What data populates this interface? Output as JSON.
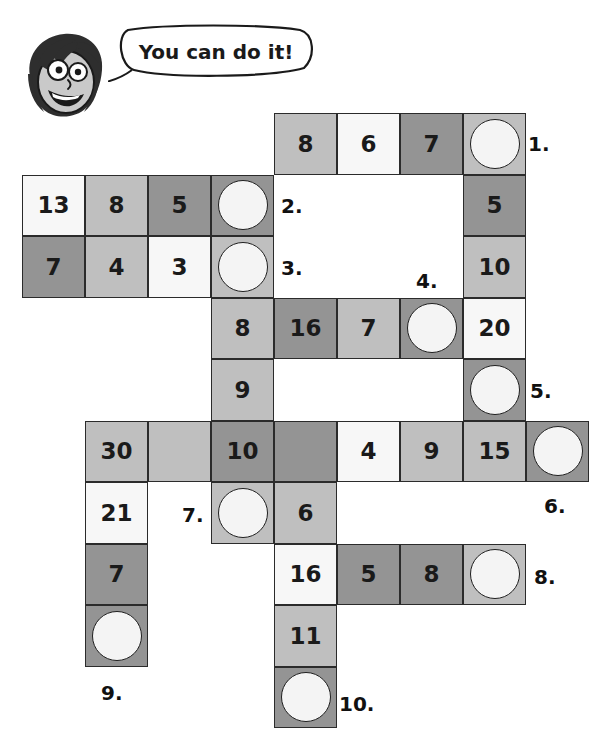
{
  "mascot": {
    "icon": "smiling-face-icon",
    "speech": "You can do it!"
  },
  "grid": {
    "origin_x": 22,
    "origin_y": 113,
    "cell_w": 63,
    "cell_h": 61.5,
    "shades": {
      "light": "#f7f7f7",
      "medium": "#bfbfbf",
      "dark": "#949494"
    },
    "cells": [
      {
        "col": 4,
        "row": 0,
        "value": "8",
        "shade": "medium",
        "circle": false
      },
      {
        "col": 5,
        "row": 0,
        "value": "6",
        "shade": "light",
        "circle": false
      },
      {
        "col": 6,
        "row": 0,
        "value": "7",
        "shade": "dark",
        "circle": false
      },
      {
        "col": 7,
        "row": 0,
        "value": "",
        "shade": "medium",
        "circle": true
      },
      {
        "col": 0,
        "row": 1,
        "value": "13",
        "shade": "light",
        "circle": false
      },
      {
        "col": 1,
        "row": 1,
        "value": "8",
        "shade": "medium",
        "circle": false
      },
      {
        "col": 2,
        "row": 1,
        "value": "5",
        "shade": "dark",
        "circle": false
      },
      {
        "col": 3,
        "row": 1,
        "value": "",
        "shade": "dark",
        "circle": true
      },
      {
        "col": 7,
        "row": 1,
        "value": "5",
        "shade": "dark",
        "circle": false
      },
      {
        "col": 0,
        "row": 2,
        "value": "7",
        "shade": "dark",
        "circle": false
      },
      {
        "col": 1,
        "row": 2,
        "value": "4",
        "shade": "medium",
        "circle": false
      },
      {
        "col": 2,
        "row": 2,
        "value": "3",
        "shade": "light",
        "circle": false
      },
      {
        "col": 3,
        "row": 2,
        "value": "",
        "shade": "medium",
        "circle": true
      },
      {
        "col": 7,
        "row": 2,
        "value": "10",
        "shade": "medium",
        "circle": false
      },
      {
        "col": 3,
        "row": 3,
        "value": "8",
        "shade": "medium",
        "circle": false
      },
      {
        "col": 4,
        "row": 3,
        "value": "16",
        "shade": "dark",
        "circle": false
      },
      {
        "col": 5,
        "row": 3,
        "value": "7",
        "shade": "medium",
        "circle": false
      },
      {
        "col": 6,
        "row": 3,
        "value": "",
        "shade": "dark",
        "circle": true
      },
      {
        "col": 7,
        "row": 3,
        "value": "20",
        "shade": "light",
        "circle": false
      },
      {
        "col": 3,
        "row": 4,
        "value": "9",
        "shade": "medium",
        "circle": false
      },
      {
        "col": 7,
        "row": 4,
        "value": "",
        "shade": "dark",
        "circle": true
      },
      {
        "col": 1,
        "row": 5,
        "value": "30",
        "shade": "medium",
        "circle": false
      },
      {
        "col": 2,
        "row": 5,
        "value": "",
        "shade": "medium",
        "circle": false
      },
      {
        "col": 3,
        "row": 5,
        "value": "10",
        "shade": "dark",
        "circle": false
      },
      {
        "col": 4,
        "row": 5,
        "value": "",
        "shade": "dark",
        "circle": false
      },
      {
        "col": 5,
        "row": 5,
        "value": "4",
        "shade": "light",
        "circle": false
      },
      {
        "col": 6,
        "row": 5,
        "value": "9",
        "shade": "medium",
        "circle": false
      },
      {
        "col": 7,
        "row": 5,
        "value": "15",
        "shade": "medium",
        "circle": false
      },
      {
        "col": 8,
        "row": 5,
        "value": "",
        "shade": "dark",
        "circle": true
      },
      {
        "col": 1,
        "row": 6,
        "value": "21",
        "shade": "light",
        "circle": false
      },
      {
        "col": 3,
        "row": 6,
        "value": "",
        "shade": "medium",
        "circle": true
      },
      {
        "col": 4,
        "row": 6,
        "value": "6",
        "shade": "medium",
        "circle": false
      },
      {
        "col": 1,
        "row": 7,
        "value": "7",
        "shade": "dark",
        "circle": false
      },
      {
        "col": 4,
        "row": 7,
        "value": "16",
        "shade": "light",
        "circle": false
      },
      {
        "col": 5,
        "row": 7,
        "value": "5",
        "shade": "dark",
        "circle": false
      },
      {
        "col": 6,
        "row": 7,
        "value": "8",
        "shade": "dark",
        "circle": false
      },
      {
        "col": 7,
        "row": 7,
        "value": "",
        "shade": "medium",
        "circle": true
      },
      {
        "col": 1,
        "row": 8,
        "value": "",
        "shade": "dark",
        "circle": true
      },
      {
        "col": 4,
        "row": 8,
        "value": "11",
        "shade": "medium",
        "circle": false
      },
      {
        "col": 4,
        "row": 9,
        "value": "",
        "shade": "dark",
        "circle": true
      }
    ],
    "clues": [
      {
        "label": "1.",
        "x": 528,
        "y": 132
      },
      {
        "label": "2.",
        "x": 281,
        "y": 194
      },
      {
        "label": "3.",
        "x": 281,
        "y": 256
      },
      {
        "label": "4.",
        "x": 416,
        "y": 269
      },
      {
        "label": "5.",
        "x": 530,
        "y": 379
      },
      {
        "label": "6.",
        "x": 544,
        "y": 494
      },
      {
        "label": "7.",
        "x": 182,
        "y": 503
      },
      {
        "label": "8.",
        "x": 534,
        "y": 565
      },
      {
        "label": "9.",
        "x": 101,
        "y": 681
      },
      {
        "label": "10.",
        "x": 339,
        "y": 692
      }
    ]
  }
}
